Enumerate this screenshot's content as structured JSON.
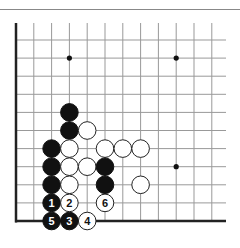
{
  "diagram": {
    "type": "go-board-fragment",
    "board": {
      "columns": 12,
      "rows": 11,
      "edges": [
        "left",
        "bottom"
      ],
      "origin_x": 16,
      "origin_y": 40,
      "spacing_x": 17.8,
      "spacing_y": 18.1,
      "top_extent": 23,
      "right_extent": 226,
      "line_color": "#999999",
      "edge_color": "#222222"
    },
    "star_points": [
      {
        "col": 3,
        "row": 1
      },
      {
        "col": 9,
        "row": 1
      },
      {
        "col": 9,
        "row": 7
      }
    ],
    "stones": [
      {
        "color": "black",
        "col": 3,
        "row": 4,
        "label": ""
      },
      {
        "color": "black",
        "col": 3,
        "row": 5,
        "label": ""
      },
      {
        "color": "white",
        "col": 4,
        "row": 5,
        "label": ""
      },
      {
        "color": "black",
        "col": 2,
        "row": 6,
        "label": ""
      },
      {
        "color": "white",
        "col": 3,
        "row": 6,
        "label": ""
      },
      {
        "color": "white",
        "col": 5,
        "row": 6,
        "label": ""
      },
      {
        "color": "white",
        "col": 6,
        "row": 6,
        "label": ""
      },
      {
        "color": "white",
        "col": 7,
        "row": 6,
        "label": ""
      },
      {
        "color": "black",
        "col": 2,
        "row": 7,
        "label": ""
      },
      {
        "color": "white",
        "col": 3,
        "row": 7,
        "label": ""
      },
      {
        "color": "white",
        "col": 4,
        "row": 7,
        "label": ""
      },
      {
        "color": "black",
        "col": 5,
        "row": 7,
        "label": ""
      },
      {
        "color": "black",
        "col": 2,
        "row": 8,
        "label": ""
      },
      {
        "color": "white",
        "col": 3,
        "row": 8,
        "label": ""
      },
      {
        "color": "black",
        "col": 5,
        "row": 8,
        "label": ""
      },
      {
        "color": "white",
        "col": 7,
        "row": 8,
        "label": ""
      },
      {
        "color": "black",
        "col": 2,
        "row": 9,
        "label": "1"
      },
      {
        "color": "white",
        "col": 3,
        "row": 9,
        "label": "2"
      },
      {
        "color": "white",
        "col": 5,
        "row": 9,
        "label": "6"
      },
      {
        "color": "black",
        "col": 2,
        "row": 10,
        "label": "5"
      },
      {
        "color": "black",
        "col": 3,
        "row": 10,
        "label": "3"
      },
      {
        "color": "white",
        "col": 4,
        "row": 10,
        "label": "4"
      }
    ],
    "colors": {
      "black_stone": "#111111",
      "white_stone": "#ffffff",
      "white_stone_border": "#222222",
      "label_on_black": "#ffffff",
      "label_on_white": "#111111",
      "top_rule": "#888888"
    }
  }
}
